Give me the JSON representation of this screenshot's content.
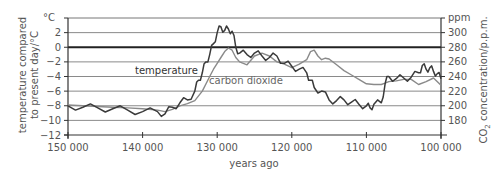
{
  "chart_data": {
    "type": "line",
    "title": "",
    "xlabel": "years ago",
    "ylabel": "temperature compared to present day/°C",
    "ylabel_lines": [
      "temperature compared",
      "to present day/°C"
    ],
    "ylabel_unit_top": "°C",
    "y2label": "CO2 concentration/p.p.m.",
    "y2label_unit_top": "ppm",
    "xlim": [
      150000,
      100000
    ],
    "ylim": [
      -12,
      4
    ],
    "y2lim": [
      160,
      320
    ],
    "x_ticks": [
      150000,
      140000,
      130000,
      120000,
      110000,
      100000
    ],
    "x_tick_labels": [
      "150 000",
      "140 000",
      "130 000",
      "120 000",
      "110 000",
      "100 000"
    ],
    "y_ticks": [
      2,
      0,
      -2,
      -4,
      -6,
      -8,
      -10,
      -12
    ],
    "y_tick_labels": [
      "2",
      "0",
      "−2",
      "−4",
      "−6",
      "−8",
      "−10",
      "−12"
    ],
    "y2_ticks": [
      300,
      280,
      260,
      240,
      220,
      200,
      180
    ],
    "y2_tick_labels": [
      "300",
      "280",
      "260",
      "240",
      "220",
      "200",
      "180"
    ],
    "grid": true,
    "legend": "inline labels",
    "series": [
      {
        "name": "temperature",
        "axis": "left",
        "color": "#444444",
        "x": [
          150000,
          148000,
          146000,
          144000,
          142000,
          140000,
          138000,
          137000,
          136000,
          135000,
          134000,
          133000,
          132500,
          132000,
          131500,
          131000,
          130500,
          130000,
          129500,
          129000,
          128500,
          128000,
          127500,
          127000,
          126000,
          125000,
          124000,
          123000,
          122000,
          121000,
          120000,
          119000,
          118000,
          117500,
          117000,
          116000,
          115000,
          114000,
          113000,
          112000,
          111000,
          110000,
          109500,
          109000,
          108000,
          107500,
          107000,
          106000,
          105000,
          104000,
          103000,
          102500,
          102000,
          101500,
          101000,
          100500,
          100000
        ],
        "values": [
          -8,
          -8.2,
          -8.3,
          -8.4,
          -8.6,
          -8.8,
          -8.8,
          -9.1,
          -8.2,
          -7.6,
          -7.2,
          -6,
          -4.5,
          -3.5,
          -2,
          -1,
          0.5,
          2,
          2.8,
          2.3,
          2.5,
          2.2,
          0,
          -0.8,
          -1,
          -0.8,
          -1.2,
          -1.4,
          -1.2,
          -2.2,
          -2.6,
          -3,
          -3.5,
          -4.5,
          -5.5,
          -6,
          -7.2,
          -7.3,
          -7.2,
          -7.5,
          -7.8,
          -8,
          -8.3,
          -7.8,
          -7.6,
          -5,
          -4,
          -4.3,
          -4.2,
          -4.1,
          -3.5,
          -2.5,
          -3,
          -2.8,
          -3.3,
          -3.6,
          -4.3
        ]
      },
      {
        "name": "carbon dioxide",
        "axis": "right",
        "color": "#888888",
        "x": [
          150000,
          148000,
          146000,
          144000,
          142000,
          140000,
          138000,
          137000,
          136000,
          135000,
          134000,
          133000,
          132000,
          131000,
          130500,
          130000,
          129500,
          129000,
          128500,
          128000,
          127500,
          127000,
          126000,
          125000,
          124000,
          123000,
          122000,
          121000,
          120000,
          119000,
          118000,
          117500,
          117000,
          116500,
          116000,
          115500,
          115000,
          114000,
          113000,
          112000,
          111000,
          110000,
          109000,
          108000,
          107500,
          107000,
          106000,
          105000,
          104000,
          103000,
          102000,
          101000,
          100000
        ],
        "values": [
          201,
          200,
          199,
          198,
          197,
          196,
          194,
          192,
          195,
          200,
          203,
          207,
          220,
          240,
          250,
          258,
          266,
          274,
          279,
          276,
          266,
          260,
          256,
          268,
          272,
          268,
          260,
          257,
          252,
          257,
          263,
          274,
          276,
          268,
          263,
          265,
          264,
          256,
          248,
          242,
          236,
          230,
          229,
          229,
          231,
          233,
          234,
          236,
          236,
          229,
          233,
          238,
          228
        ]
      }
    ]
  }
}
